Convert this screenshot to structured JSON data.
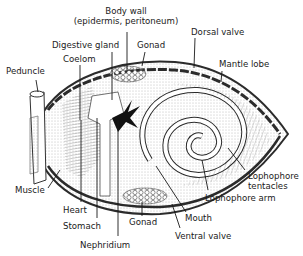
{
  "diagram": {
    "colors": {
      "ink": "#1a1a1a",
      "shell": "#2b2b2b",
      "stipple": "#8a8a8a",
      "background": "#ffffff"
    },
    "labels": {
      "body_wall_1": "Body wall",
      "body_wall_2": "(epidermis, peritoneum)",
      "digestive_gland": "Digestive gland",
      "coelom": "Coelom",
      "gonad_top": "Gonad",
      "dorsal_valve": "Dorsal valve",
      "mantle_lobe": "Mantle lobe",
      "peduncle": "Peduncle",
      "lophophore_tentacles_1": "Lophophore",
      "lophophore_tentacles_2": "tentacles",
      "lophophore_arm": "Lophophore arm",
      "muscle": "Muscle",
      "heart": "Heart",
      "stomach": "Stomach",
      "nephridium": "Nephridium",
      "gonad_bottom": "Gonad",
      "mouth": "Mouth",
      "ventral_valve": "Ventral valve"
    }
  }
}
